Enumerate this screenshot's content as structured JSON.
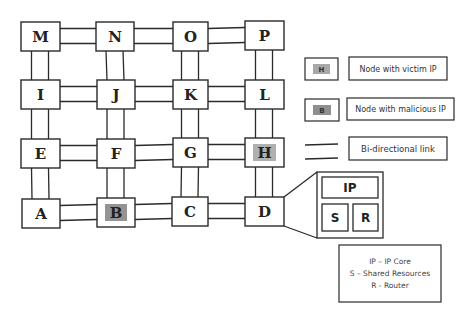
{
  "diagram": {
    "type": "4x4 mesh network-on-chip",
    "colors": {
      "stroke": "#2a2a2a",
      "highlight": "#9a9a9a",
      "background": "#ffffff"
    },
    "nodes": [
      {
        "id": "M",
        "label": "M",
        "x": 21,
        "y": 22,
        "w": 39,
        "h": 29,
        "role": "normal"
      },
      {
        "id": "N",
        "label": "N",
        "x": 96,
        "y": 22,
        "w": 38,
        "h": 29,
        "role": "normal"
      },
      {
        "id": "O",
        "label": "O",
        "x": 173,
        "y": 22,
        "w": 35,
        "h": 29,
        "role": "normal"
      },
      {
        "id": "P",
        "label": "P",
        "x": 245,
        "y": 21,
        "w": 39,
        "h": 29,
        "role": "normal"
      },
      {
        "id": "I",
        "label": "I",
        "x": 21,
        "y": 80,
        "w": 39,
        "h": 29,
        "role": "normal"
      },
      {
        "id": "J",
        "label": "J",
        "x": 97,
        "y": 80,
        "w": 38,
        "h": 29,
        "role": "normal"
      },
      {
        "id": "K",
        "label": "K",
        "x": 173,
        "y": 80,
        "w": 35,
        "h": 29,
        "role": "normal"
      },
      {
        "id": "L",
        "label": "L",
        "x": 245,
        "y": 80,
        "w": 39,
        "h": 29,
        "role": "normal"
      },
      {
        "id": "E",
        "label": "E",
        "x": 21,
        "y": 139,
        "w": 39,
        "h": 29,
        "role": "normal"
      },
      {
        "id": "F",
        "label": "F",
        "x": 97,
        "y": 139,
        "w": 38,
        "h": 29,
        "role": "normal"
      },
      {
        "id": "G",
        "label": "G",
        "x": 173,
        "y": 138,
        "w": 35,
        "h": 29,
        "role": "normal"
      },
      {
        "id": "H",
        "label": "H",
        "x": 245,
        "y": 138,
        "w": 39,
        "h": 29,
        "role": "victim"
      },
      {
        "id": "A",
        "label": "A",
        "x": 22,
        "y": 199,
        "w": 38,
        "h": 29,
        "role": "normal"
      },
      {
        "id": "B",
        "label": "B",
        "x": 97,
        "y": 198,
        "w": 38,
        "h": 29,
        "role": "malicious"
      },
      {
        "id": "C",
        "label": "C",
        "x": 172,
        "y": 197,
        "w": 36,
        "h": 29,
        "role": "normal"
      },
      {
        "id": "D",
        "label": "D",
        "x": 245,
        "y": 197,
        "w": 39,
        "h": 29,
        "role": "normal"
      }
    ],
    "links": [
      [
        "M",
        "N"
      ],
      [
        "N",
        "O"
      ],
      [
        "O",
        "P"
      ],
      [
        "I",
        "J"
      ],
      [
        "J",
        "K"
      ],
      [
        "K",
        "L"
      ],
      [
        "E",
        "F"
      ],
      [
        "F",
        "G"
      ],
      [
        "G",
        "H"
      ],
      [
        "A",
        "B"
      ],
      [
        "B",
        "C"
      ],
      [
        "C",
        "D"
      ],
      [
        "M",
        "I"
      ],
      [
        "I",
        "E"
      ],
      [
        "E",
        "A"
      ],
      [
        "N",
        "J"
      ],
      [
        "J",
        "F"
      ],
      [
        "F",
        "B"
      ],
      [
        "O",
        "K"
      ],
      [
        "K",
        "G"
      ],
      [
        "G",
        "C"
      ],
      [
        "P",
        "L"
      ],
      [
        "L",
        "H"
      ],
      [
        "H",
        "D"
      ]
    ],
    "detail": {
      "of_node": "D",
      "ip_label": "IP",
      "s_label": "S",
      "r_label": "R"
    },
    "legend": {
      "victim": {
        "chip": "H",
        "label": "Node with victim IP"
      },
      "malicious": {
        "chip": "B",
        "label": "Node with malicious IP"
      },
      "link": {
        "label": "Bi-directional link"
      },
      "key_lines": [
        "IP – IP Core",
        "S – Shared Resources",
        "R - Router"
      ]
    }
  }
}
